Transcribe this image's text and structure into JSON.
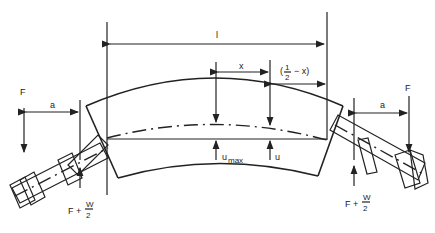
{
  "labels": {
    "span_length": "l",
    "offset_x": "x",
    "half_minus_x_open": "(",
    "half_num": "1",
    "half_den": "2",
    "half_minus_x_rest": "− x)",
    "force_left": "F",
    "force_right": "F",
    "arm_left": "a",
    "arm_right": "a",
    "deflection_max": "u",
    "deflection_max_sub": "max",
    "deflection": "u",
    "reaction_left_prefix": "F +",
    "reaction_left_num": "W",
    "reaction_left_den": "2",
    "reaction_right_prefix": "F +",
    "reaction_right_num": "W",
    "reaction_right_den": "2"
  }
}
